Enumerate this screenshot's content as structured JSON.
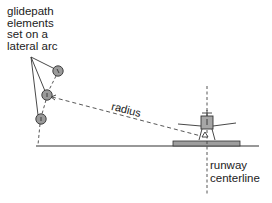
{
  "diagram": {
    "caption_lines": [
      "glidepath",
      "elements",
      "set on a",
      "lateral arc"
    ],
    "radius_label": "radius",
    "centerline_label_lines": [
      "runway",
      "centerline"
    ],
    "elements": [
      {
        "id": 1,
        "cx": 58,
        "cy": 71,
        "r": 5.2
      },
      {
        "id": 2,
        "cx": 47,
        "cy": 95,
        "r": 5.2
      },
      {
        "id": 3,
        "cx": 41,
        "cy": 119,
        "r": 5.2
      }
    ],
    "colors": {
      "line": "#333333",
      "element_fill": "#9a9a9a",
      "aircraft_fill": "#a6a6a6",
      "runway_fill": "#9e9e9e",
      "text": "#222222"
    }
  }
}
